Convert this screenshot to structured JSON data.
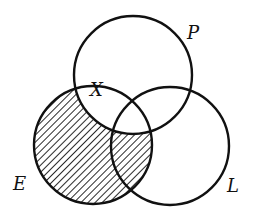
{
  "diagram": {
    "type": "venn",
    "sets": [
      {
        "id": "P",
        "label": "P",
        "cx": 133,
        "cy": 75,
        "r": 59,
        "label_x": 187,
        "label_y": 39
      },
      {
        "id": "E",
        "label": "E",
        "cx": 93,
        "cy": 145,
        "r": 59,
        "label_x": 13,
        "label_y": 190
      },
      {
        "id": "L",
        "label": "L",
        "cx": 170,
        "cy": 146,
        "r": 59,
        "label_x": 227,
        "label_y": 192
      }
    ],
    "point_label": {
      "text": "X",
      "x": 90,
      "y": 96
    },
    "shaded_region": "E minus P",
    "colors": {
      "stroke": "#111111",
      "hatch": "#111111",
      "background": "#ffffff"
    }
  }
}
